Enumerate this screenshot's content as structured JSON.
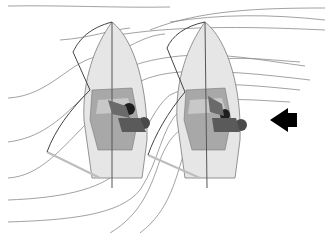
{
  "diagram": {
    "colors": {
      "background": "#ffffff",
      "streamline": "#8a8a8a",
      "hull_fill": "#e6e6e6",
      "hull_stroke": "#7a7a7a",
      "cockpit_fill": "#a8a8a8",
      "cockpit_light": "#c8c8c8",
      "sail_stroke": "#444444",
      "boom": "#bdbdbd",
      "mast": "#555555",
      "sailor_dark": "#3a3a3a",
      "sailor_mid": "#6a6a6a",
      "arrow": "#000000"
    },
    "boats": [
      {
        "id": "boat-left",
        "label": "windward-boat"
      },
      {
        "id": "boat-right",
        "label": "leeward-boat"
      }
    ],
    "wind_arrow": {
      "direction": "left"
    }
  }
}
